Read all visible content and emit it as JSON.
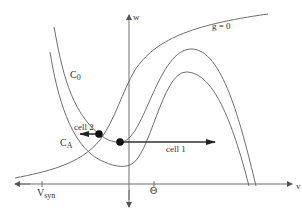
{
  "axes": {
    "x_label": "v",
    "y_label": "w",
    "x_ticks": [
      {
        "label": "V",
        "sub": "syn",
        "x": 42
      },
      {
        "label": "Θ",
        "x": 154
      }
    ]
  },
  "curves": {
    "g_nullcline_label": "g = 0",
    "upper_cubic_label": "C",
    "upper_cubic_sub": "0",
    "lower_cubic_label": "C",
    "lower_cubic_sub": "A"
  },
  "cells": [
    {
      "label": "cell 1",
      "direction": "right"
    },
    {
      "label": "cell 2",
      "direction": "left"
    }
  ],
  "colors": {
    "curve": "#6e6e6e",
    "text": "#333333",
    "background": "#ffffff"
  }
}
